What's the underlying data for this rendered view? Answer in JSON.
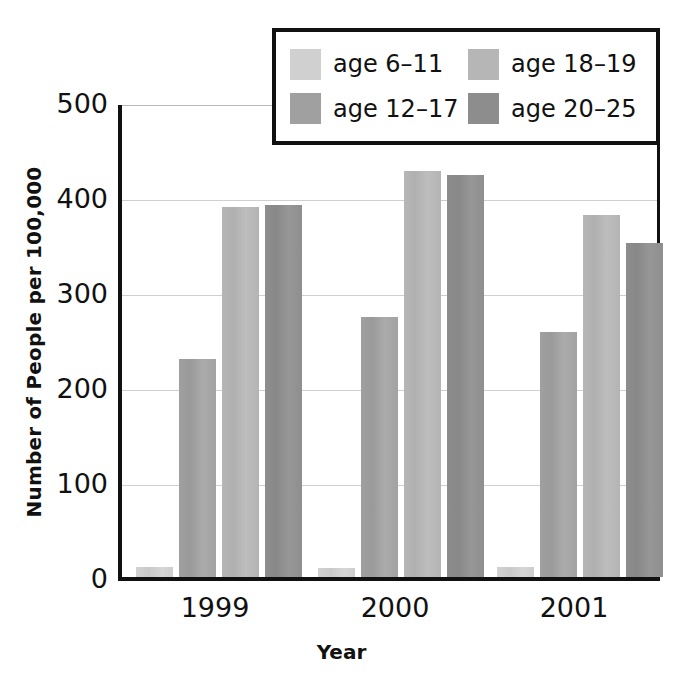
{
  "chart_data": {
    "type": "bar",
    "title": "",
    "xlabel": "Year",
    "ylabel": "Number of People per 100,000",
    "categories": [
      "1999",
      "2000",
      "2001"
    ],
    "series": [
      {
        "name": "age 6–11",
        "values": [
          10,
          9,
          10
        ],
        "color": "#d0d0d0"
      },
      {
        "name": "age 12–17",
        "values": [
          229,
          273,
          257
        ],
        "color": "#a0a0a0"
      },
      {
        "name": "age 18–19",
        "values": [
          389,
          427,
          380
        ],
        "color": "#b6b6b6"
      },
      {
        "name": "age 20–25",
        "values": [
          391,
          422,
          351
        ],
        "color": "#8d8d8d"
      }
    ],
    "ylim": [
      0,
      500
    ],
    "yticks": [
      0,
      100,
      200,
      300,
      400,
      500
    ],
    "ytick_labels": [
      "0",
      "100",
      "200",
      "300",
      "400",
      "500"
    ],
    "grid": "horizontal",
    "legend_position": "top-center-outside",
    "legend_layout": "2x2",
    "axis_color": "#111111",
    "grid_color": "#cfcfcf",
    "background": "#ffffff"
  }
}
